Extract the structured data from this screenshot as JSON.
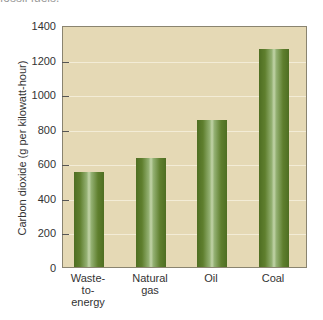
{
  "header": {
    "cropped_caption": "fossil fuels."
  },
  "chart_data": {
    "type": "bar",
    "title": "",
    "xlabel": "",
    "ylabel": "Carbon dioxide (g per kilowatt-hour)",
    "categories": [
      "Waste-\nto-\nenergy",
      "Natural\ngas",
      "Oil",
      "Coal"
    ],
    "values": [
      550,
      630,
      850,
      1260
    ],
    "ylim": [
      0,
      1400
    ],
    "yticks": [
      "0",
      "200",
      "400",
      "600",
      "800",
      "1000",
      "1200",
      "1400"
    ],
    "grid": true,
    "legend": null,
    "colors": {
      "plot_background": "#e5d9b5",
      "bar": "#5f7f2e",
      "bar_highlight": "#c2d4a8",
      "gridline": "#f3ecd6"
    }
  }
}
